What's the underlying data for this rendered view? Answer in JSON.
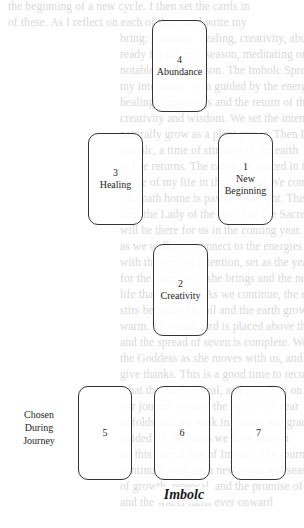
{
  "page": {
    "type": "tarot-spread-diagram",
    "background": "#ffffff",
    "line_color": "#333333"
  },
  "bleed_through": {
    "description": "faint show-through text from reverse page",
    "lines": [
      "the beginning of a new cycle. I then set the cards in",
      "of these. As I reflect on each of these and write my",
      "bring: guidance, healing, creativity, abundance and hope",
      "ready for the new season, meditating on each card",
      "notable, to the season. The Imbolc Spread helps",
      "my intentions. I am guided by the energies of",
      "healing, beginnings and the return of the sun. The community",
      "creativity and wisdom. We set the intention of",
      "naturally grow as a plant grows. Then I lay three",
      "Imbolc, a time of stirrings in the earth",
      "as life returns. The cards are placed in their spread",
      "flame of my life in the process. We come to the",
      "The path home is paved with light. The Bright",
      "then the Lady of the Well and the Sacred Flame",
      "will be there for us in the coming year. The",
      "as we walk, we connect to the energies present",
      "with the seed of intention, set as the year turns",
      "for the many gifts she brings and the new",
      "life that awakens. As we continue, the energy",
      "stirs beneath the soil and the earth grows",
      "warm. The third card is placed above the first.",
      "and the spread of seven is complete. We honor",
      "the Goddess as she moves with us, and we",
      "give thanks. This is a good time to record",
      "what the cards reveal, and to reflect on",
      "our journey toward the light. The year",
      "unfolds and we walk in beauty and grace",
      "guided by the cards we have chosen",
      "on this sacred day of Imbolc. The journey",
      "continues with each new dawn and season",
      "of growth, renewal, and the promise of spring",
      "and the wheel turns ever onward"
    ]
  },
  "cards": [
    {
      "id": "card-4",
      "number": "4",
      "label": "Abundance",
      "x": 152,
      "y": 20,
      "w": 55,
      "h": 92
    },
    {
      "id": "card-3",
      "number": "3",
      "label": "Healing",
      "x": 88,
      "y": 133,
      "w": 55,
      "h": 92
    },
    {
      "id": "card-1",
      "number": "1",
      "label_line1": "New",
      "label_line2": "Beginning",
      "x": 218,
      "y": 133,
      "w": 55,
      "h": 92
    },
    {
      "id": "card-2",
      "number": "2",
      "label": "Creativity",
      "x": 153,
      "y": 244,
      "w": 55,
      "h": 92
    },
    {
      "id": "card-5",
      "number": "5",
      "label": "",
      "x": 78,
      "y": 386,
      "w": 54,
      "h": 94
    },
    {
      "id": "card-6",
      "number": "6",
      "label": "",
      "x": 154,
      "y": 386,
      "w": 56,
      "h": 94
    },
    {
      "id": "card-7",
      "number": "7",
      "label": "",
      "x": 231,
      "y": 386,
      "w": 55,
      "h": 94
    }
  ],
  "side_label": {
    "line1": "Chosen",
    "line2": "During",
    "line3": "Journey"
  },
  "caption": "Imbolc"
}
